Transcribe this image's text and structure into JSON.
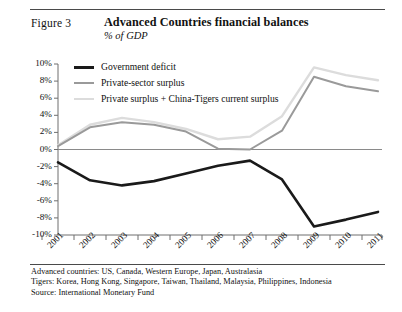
{
  "figure": {
    "label": "Figure 3",
    "title": "Advanced Countries financial balances",
    "subtitle": "% of GDP"
  },
  "notes": [
    "Advanced countries: US, Canada, Western Europe, Japan, Australasia",
    "Tigers: Korea, Hong Kong, Singapore, Taiwan, Thailand, Malaysia, Philippines, Indonesia",
    "Source: International Monetary Fund"
  ],
  "colors": {
    "government_deficit": "#1a1a1a",
    "private_sector_surplus": "#9a9a9a",
    "private_plus_tigers": "#dcdcdc",
    "axis": "#6f6f6f",
    "zero_line": "#8a8a8a",
    "rule": "#4a4a4a"
  },
  "chart_data": {
    "type": "line",
    "title": "Advanced Countries financial balances",
    "subtitle": "% of GDP",
    "xlabel": "",
    "ylabel": "% of GDP",
    "categories": [
      "2001",
      "2002",
      "2003",
      "2004",
      "2005",
      "2006",
      "2007",
      "2008",
      "2009",
      "2010",
      "2011"
    ],
    "ylim": [
      -10,
      10
    ],
    "ytick_labels": [
      "10%",
      "8%",
      "6%",
      "4%",
      "2%",
      "0%",
      "-2%",
      "-4%",
      "-6%",
      "-8%",
      "-10%"
    ],
    "ytick_values": [
      10,
      8,
      6,
      4,
      2,
      0,
      -2,
      -4,
      -6,
      -8,
      -10
    ],
    "grid": false,
    "zero_line": true,
    "legend_position": "top-left-inside",
    "series": [
      {
        "name": "Government deficit",
        "color": "#1a1a1a",
        "width": 2.6,
        "values": [
          -1.5,
          -3.6,
          -4.2,
          -3.7,
          -2.8,
          -1.9,
          -1.3,
          -3.5,
          -9.0,
          -8.2,
          -7.3
        ]
      },
      {
        "name": "Private-sector surplus",
        "color": "#9a9a9a",
        "width": 2.0,
        "values": [
          0.4,
          2.6,
          3.2,
          2.9,
          2.1,
          0.1,
          0.0,
          2.2,
          8.5,
          7.4,
          6.8
        ]
      },
      {
        "name": "Private surplus + China-Tigers current surplus",
        "color": "#dcdcdc",
        "width": 2.4,
        "values": [
          0.5,
          2.9,
          3.7,
          3.2,
          2.4,
          1.2,
          1.5,
          3.9,
          9.6,
          8.7,
          8.1
        ]
      }
    ]
  }
}
